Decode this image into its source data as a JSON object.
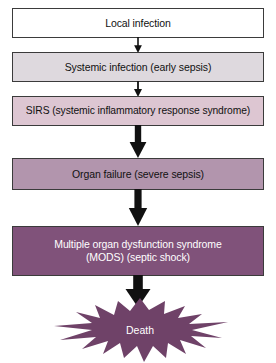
{
  "diagram": {
    "colors": {
      "box_local_bg": "#ffffff",
      "box_systemic_bg": "#ded9de",
      "box_sirs_bg": "#ddc6d2",
      "box_organ_bg": "#b295ad",
      "box_mods_bg": "#80527a",
      "burst_fill": "#6f4268",
      "border": "#3b3b3b",
      "arrow": "#111111",
      "text_dark": "#111111",
      "text_light": "#ffffff"
    },
    "stages": [
      {
        "id": "local",
        "label": "Local infection"
      },
      {
        "id": "systemic",
        "label": "Systemic infection (early sepsis)"
      },
      {
        "id": "sirs",
        "label": "SIRS (systemic inflammatory response syndrome)"
      },
      {
        "id": "organ",
        "label": "Organ failure (severe sepsis)"
      },
      {
        "id": "mods",
        "label": "Multiple organ dysfunction syndrome\n(MODS) (septic shock)"
      }
    ],
    "outcome": {
      "id": "death",
      "label": "Death",
      "shape": "starburst"
    },
    "connectors": [
      {
        "id": "arrow-1",
        "from": "local",
        "to": "systemic",
        "weight": "thin"
      },
      {
        "id": "arrow-2",
        "from": "systemic",
        "to": "sirs",
        "weight": "thin"
      },
      {
        "id": "arrow-3",
        "from": "sirs",
        "to": "organ",
        "weight": "medium"
      },
      {
        "id": "arrow-4",
        "from": "organ",
        "to": "mods",
        "weight": "medium"
      },
      {
        "id": "arrow-5",
        "from": "mods",
        "to": "death",
        "weight": "thick"
      }
    ]
  }
}
